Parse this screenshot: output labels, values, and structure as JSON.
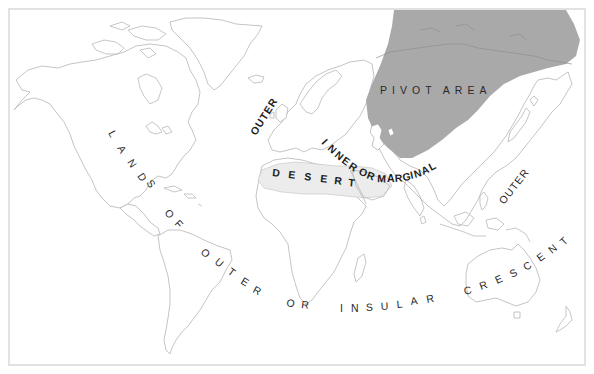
{
  "map": {
    "title": "Mackinder Heartland World Map",
    "colors": {
      "pivot_area_fill": "#a9a9a9",
      "desert_fill": "#ececec",
      "coastline": "#b9b9b9",
      "label_text": "#2a2a2a",
      "frame_border": "#e2e2e2",
      "background": "#ffffff"
    },
    "regions": {
      "pivot_area": {
        "label": "PIVOT AREA",
        "letters": [
          "P",
          "I",
          "V",
          "O",
          "T",
          "A",
          "R",
          "E",
          "A"
        ]
      },
      "desert": {
        "label": "DESERT",
        "letters": [
          "D",
          "E",
          "S",
          "E",
          "R",
          "T"
        ]
      },
      "inner_crescent": {
        "label": "INNER OR MARGINAL",
        "letters": [
          "I",
          "N",
          "N",
          "E",
          "R",
          "O",
          "R",
          "M",
          "A",
          "R",
          "G",
          "I",
          "N",
          "A",
          "L"
        ]
      },
      "outer_europe": {
        "label": "OUTER",
        "letters": [
          "O",
          "U",
          "T",
          "E",
          "R"
        ]
      },
      "outer_asia": {
        "label": "OUTER",
        "letters": [
          "O",
          "U",
          "T",
          "E",
          "R"
        ]
      },
      "outer_crescent": {
        "label": "LANDS OF OUTER OR INSULAR CRESCENT",
        "letters": [
          "L",
          "A",
          "N",
          "D",
          "S",
          "O",
          "F",
          "O",
          "U",
          "T",
          "E",
          "R",
          "O",
          "R",
          "I",
          "N",
          "S",
          "U",
          "L",
          "A",
          "R",
          "C",
          "R",
          "E",
          "S",
          "C",
          "E",
          "N",
          "T"
        ]
      }
    }
  }
}
